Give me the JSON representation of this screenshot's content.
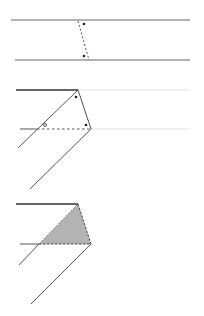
{
  "diagram": {
    "colors": {
      "line": "#555555",
      "faint_line": "#dddddd",
      "shade": "#b3b3b3",
      "dot": "#222222"
    },
    "panels": [
      {
        "id": "strip",
        "label": ""
      },
      {
        "id": "folded-strip",
        "label": ""
      },
      {
        "id": "shaded-triangle",
        "label": ""
      }
    ],
    "angle_marker": "o"
  }
}
